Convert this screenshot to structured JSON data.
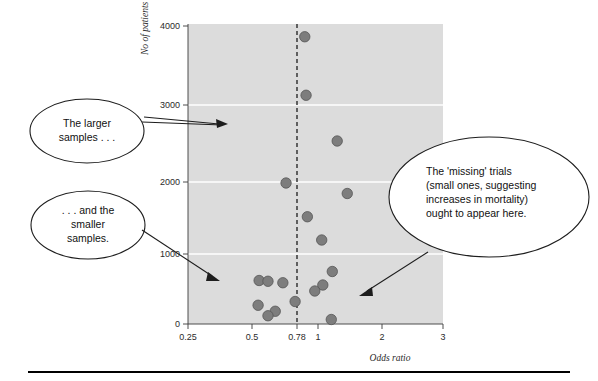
{
  "figure": {
    "name": "funnel-plot-publication-bias",
    "background_color": "#ffffff",
    "plot_background_color": "#dcdcdc",
    "dot_color": "#7d7d7d",
    "gridline_color": "#ffffff",
    "reference_line_color": "#1c1c1c"
  },
  "chart_data": {
    "type": "scatter",
    "title": "",
    "subtitle": "",
    "xlabel": "Odds ratio",
    "ylabel": "No of patients",
    "xscale": "log",
    "xlim": [
      0.25,
      3
    ],
    "ylim": [
      0,
      4000
    ],
    "grid": true,
    "legend": "none",
    "x_tick_labels": [
      "0.25",
      "0.5",
      "0.78",
      "1",
      "2",
      "3"
    ],
    "x_tick_values": [
      0.25,
      0.5,
      0.78,
      1,
      2,
      3
    ],
    "y_tick_labels": [
      "0",
      "1000",
      "2000",
      "3000",
      "4000"
    ],
    "y_tick_values": [
      0,
      1000,
      2000,
      3000,
      4000
    ],
    "reference_line": {
      "orientation": "vertical",
      "value": 0.78,
      "style": "dashed",
      "label": "0.78"
    },
    "points": [
      {
        "x": 0.78,
        "y": 3830
      },
      {
        "x": 0.79,
        "y": 3050
      },
      {
        "x": 1.07,
        "y": 2440
      },
      {
        "x": 0.65,
        "y": 1880
      },
      {
        "x": 1.18,
        "y": 1740
      },
      {
        "x": 0.8,
        "y": 1430
      },
      {
        "x": 0.92,
        "y": 1120
      },
      {
        "x": 1.02,
        "y": 700
      },
      {
        "x": 0.5,
        "y": 580
      },
      {
        "x": 0.545,
        "y": 570
      },
      {
        "x": 0.63,
        "y": 550
      },
      {
        "x": 0.93,
        "y": 520
      },
      {
        "x": 0.86,
        "y": 440
      },
      {
        "x": 0.495,
        "y": 250
      },
      {
        "x": 0.71,
        "y": 300
      },
      {
        "x": 0.585,
        "y": 170
      },
      {
        "x": 0.545,
        "y": 110
      },
      {
        "x": 1.01,
        "y": 60
      }
    ],
    "annotations": [
      {
        "id": "larger-samples",
        "lines": [
          "The larger",
          "samples . . ."
        ],
        "shape": "ellipse",
        "points_to": "upper region of plot near 3000 patients"
      },
      {
        "id": "smaller-samples",
        "lines": [
          ". . . and the",
          "smaller",
          "samples."
        ],
        "shape": "ellipse",
        "points_to": "lower left cluster of small trials"
      },
      {
        "id": "missing-trials",
        "lines": [
          "The 'missing' trials",
          "(small ones, suggesting",
          "increases in mortality)",
          "ought to appear here."
        ],
        "shape": "ellipse",
        "points_to": "empty lower right region of plot"
      }
    ]
  }
}
